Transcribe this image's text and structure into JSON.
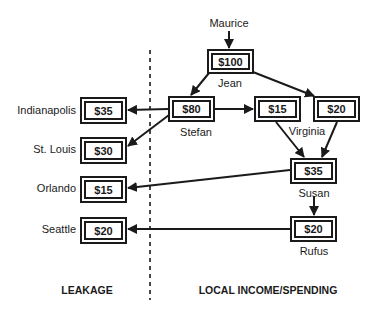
{
  "diagram": {
    "source_label": "Maurice",
    "local_nodes": [
      {
        "id": "jean",
        "name": "Jean",
        "amount": "$100"
      },
      {
        "id": "stefan",
        "name": "Stefan",
        "amount": "$80"
      },
      {
        "id": "virginia-a",
        "name": "",
        "amount": "$15"
      },
      {
        "id": "virginia-b",
        "name": "",
        "amount": "$20"
      },
      {
        "id": "susan",
        "name": "Susan",
        "amount": "$35"
      },
      {
        "id": "rufus",
        "name": "Rufus",
        "amount": "$20"
      }
    ],
    "virginia_label": "Virginia",
    "leakage_nodes": [
      {
        "id": "indianapolis",
        "name": "Indianapolis",
        "amount": "$35"
      },
      {
        "id": "st-louis",
        "name": "St. Louis",
        "amount": "$30"
      },
      {
        "id": "orlando",
        "name": "Orlando",
        "amount": "$15"
      },
      {
        "id": "seattle",
        "name": "Seattle",
        "amount": "$20"
      }
    ],
    "flows": [
      {
        "from": "maurice",
        "to": "jean"
      },
      {
        "from": "jean",
        "to": "stefan"
      },
      {
        "from": "jean",
        "to": "virginia-b"
      },
      {
        "from": "stefan",
        "to": "virginia-a"
      },
      {
        "from": "stefan",
        "to": "indianapolis"
      },
      {
        "from": "stefan",
        "to": "st-louis"
      },
      {
        "from": "virginia-a",
        "to": "susan"
      },
      {
        "from": "virginia-b",
        "to": "susan"
      },
      {
        "from": "susan",
        "to": "orlando"
      },
      {
        "from": "susan",
        "to": "rufus"
      },
      {
        "from": "rufus",
        "to": "seattle"
      }
    ],
    "footer": {
      "leakage": "LEAKAGE",
      "local": "LOCAL INCOME/SPENDING"
    }
  }
}
